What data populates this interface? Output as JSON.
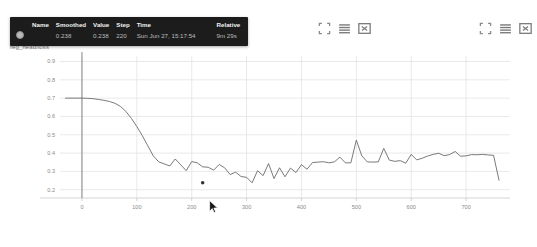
{
  "chart_title": "reg_head/loss",
  "toolbars": [
    {
      "name": "toolbar-left",
      "icons": [
        {
          "name": "fullscreen-icon",
          "label": "Toggle fit domain"
        },
        {
          "name": "lines-icon",
          "label": "Toggle y-axis scale"
        },
        {
          "name": "expand-box-icon",
          "label": "Expand chart"
        }
      ]
    },
    {
      "name": "toolbar-right",
      "icons": [
        {
          "name": "fullscreen-icon",
          "label": "Toggle fit domain"
        },
        {
          "name": "lines-icon",
          "label": "Toggle y-axis scale"
        },
        {
          "name": "expand-box-icon",
          "label": "Expand chart"
        }
      ]
    }
  ],
  "tooltip": {
    "headers": {
      "name": "Name",
      "smoothed": "Smoothed",
      "value": "Value",
      "step": "Step",
      "time": "Time",
      "relative": "Relative"
    },
    "row": {
      "name": "",
      "smoothed": "0.238",
      "value": "0.238",
      "step": "220",
      "time": "Sun Jun 27, 15:17:54",
      "relative": "9m 29s",
      "swatch_color": "#b9b9b9"
    }
  },
  "chart_data": {
    "type": "line",
    "title": "reg_head/loss",
    "xlabel": "",
    "ylabel": "",
    "xlim": [
      -40,
      780
    ],
    "ylim": [
      0.155,
      0.93
    ],
    "xticks": [
      0,
      100,
      200,
      300,
      400,
      500,
      600,
      700
    ],
    "yticks": [
      0.2,
      0.3,
      0.4,
      0.5,
      0.6,
      0.7,
      0.8,
      0.9
    ],
    "grid": true,
    "legend": "none",
    "line_color": "#6b6b6b",
    "crosshair_x": 0,
    "highlight_point": {
      "x": 220,
      "y": 0.238
    },
    "series": [
      {
        "name": "reg_head/loss",
        "x": [
          -30,
          0,
          10,
          20,
          30,
          40,
          50,
          60,
          70,
          80,
          90,
          100,
          110,
          120,
          130,
          140,
          150,
          160,
          170,
          180,
          190,
          200,
          210,
          220,
          230,
          240,
          250,
          260,
          270,
          280,
          290,
          300,
          310,
          320,
          330,
          340,
          350,
          360,
          370,
          380,
          390,
          400,
          410,
          420,
          430,
          440,
          450,
          460,
          470,
          480,
          490,
          500,
          510,
          520,
          530,
          540,
          550,
          560,
          570,
          580,
          590,
          600,
          610,
          620,
          630,
          640,
          650,
          660,
          670,
          680,
          690,
          700,
          710,
          720,
          730,
          740,
          750,
          760
        ],
        "y": [
          0.7,
          0.7,
          0.699,
          0.697,
          0.693,
          0.688,
          0.682,
          0.672,
          0.655,
          0.628,
          0.59,
          0.545,
          0.495,
          0.44,
          0.385,
          0.352,
          0.341,
          0.33,
          0.368,
          0.336,
          0.304,
          0.354,
          0.347,
          0.325,
          0.323,
          0.307,
          0.338,
          0.32,
          0.283,
          0.296,
          0.272,
          0.268,
          0.238,
          0.304,
          0.277,
          0.343,
          0.261,
          0.32,
          0.271,
          0.318,
          0.294,
          0.337,
          0.312,
          0.348,
          0.351,
          0.353,
          0.347,
          0.352,
          0.378,
          0.347,
          0.347,
          0.471,
          0.385,
          0.352,
          0.351,
          0.352,
          0.426,
          0.362,
          0.355,
          0.359,
          0.345,
          0.393,
          0.363,
          0.372,
          0.384,
          0.393,
          0.399,
          0.386,
          0.392,
          0.409,
          0.383,
          0.385,
          0.392,
          0.391,
          0.393,
          0.39,
          0.388,
          0.252
        ]
      }
    ]
  }
}
